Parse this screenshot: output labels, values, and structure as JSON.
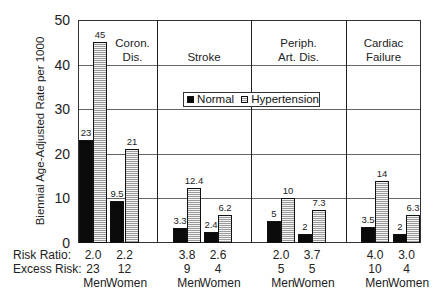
{
  "chart_data": {
    "type": "bar",
    "title": "",
    "xlabel": "",
    "ylabel": "Biennial Age-Adjusted Rate per 1000",
    "ylim": [
      0,
      50
    ],
    "yticks": [
      "0",
      "10",
      "20",
      "30",
      "40",
      "50"
    ],
    "grid": true,
    "legend": {
      "position": "inside-center",
      "entries": [
        "Normal",
        "Hypertension"
      ]
    },
    "panels": [
      {
        "title_lines": [
          "Coron.",
          "Dis."
        ],
        "groups": [
          {
            "sex": "Men",
            "normal": 23,
            "hypertension": 45,
            "normal_label": "23",
            "hypertension_label": "45",
            "risk_ratio": "2.0",
            "excess_risk": "23"
          },
          {
            "sex": "Women",
            "normal": 9.5,
            "hypertension": 21,
            "normal_label": "9.5",
            "hypertension_label": "21",
            "risk_ratio": "2.2",
            "excess_risk": "12"
          }
        ]
      },
      {
        "title_lines": [
          "",
          "Stroke"
        ],
        "groups": [
          {
            "sex": "Men",
            "normal": 3.3,
            "hypertension": 12.4,
            "normal_label": "3.3",
            "hypertension_label": "12.4",
            "risk_ratio": "3.8",
            "excess_risk": "9"
          },
          {
            "sex": "Women",
            "normal": 2.4,
            "hypertension": 6.2,
            "normal_label": "2.4",
            "hypertension_label": "6.2",
            "risk_ratio": "2.6",
            "excess_risk": "4"
          }
        ]
      },
      {
        "title_lines": [
          "Periph.",
          "Art. Dis."
        ],
        "groups": [
          {
            "sex": "Men",
            "normal": 5,
            "hypertension": 10,
            "normal_label": "5",
            "hypertension_label": "10",
            "risk_ratio": "2.0",
            "excess_risk": "5"
          },
          {
            "sex": "Women",
            "normal": 2,
            "hypertension": 7.3,
            "normal_label": "2",
            "hypertension_label": "7.3",
            "risk_ratio": "3.7",
            "excess_risk": "5"
          }
        ]
      },
      {
        "title_lines": [
          "Cardiac",
          "Failure"
        ],
        "groups": [
          {
            "sex": "Men",
            "normal": 3.5,
            "hypertension": 14,
            "normal_label": "3.5",
            "hypertension_label": "14",
            "risk_ratio": "4.0",
            "excess_risk": "10"
          },
          {
            "sex": "Women",
            "normal": 2,
            "hypertension": 6.3,
            "normal_label": "2",
            "hypertension_label": "6.3",
            "risk_ratio": "3.0",
            "excess_risk": "4"
          }
        ]
      }
    ],
    "categories": [
      "Coron. Dis. Men",
      "Coron. Dis. Women",
      "Stroke Men",
      "Stroke Women",
      "Periph. Art. Dis. Men",
      "Periph. Art. Dis. Women",
      "Cardiac Failure Men",
      "Cardiac Failure Women"
    ],
    "series": [
      {
        "name": "Normal",
        "values": [
          23,
          9.5,
          3.3,
          2.4,
          5,
          2,
          3.5,
          2
        ]
      },
      {
        "name": "Hypertension",
        "values": [
          45,
          21,
          12.4,
          6.2,
          10,
          7.3,
          14,
          6.3
        ]
      }
    ],
    "row_labels": {
      "risk_ratio": "Risk Ratio:",
      "excess_risk": "Excess Risk:"
    }
  }
}
